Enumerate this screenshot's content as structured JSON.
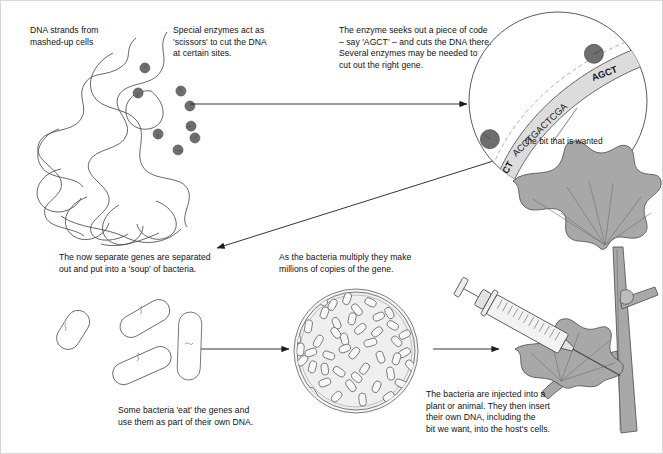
{
  "diagram": {
    "type": "process-flow-illustration",
    "background_color": "#ffffff",
    "line_color": "#3a3a3a",
    "enzyme_color": "#6e6e6e",
    "plant_color": "#a8a8a8",
    "dish_fill": "#efefef"
  },
  "captions": {
    "dna_strands": "DNA strands from\nmashed-up cells",
    "enzymes": "Special enzymes act as\n'scissors' to cut the DNA\nat certain sites.",
    "seeks_code": "The enzyme seeks out a piece of code\n– say 'AGCT' – and cuts the DNA there.\nSeveral enzymes may be needed to\ncut out the right gene.",
    "bit_wanted": "the bit that is wanted",
    "separated": "The now separate genes are separated\nout and put into a 'soup' of bacteria.",
    "multiply": "As the bacteria multiply they make\nmillions of copies of the gene.",
    "bacteria_eat": "Some bacteria 'eat' the genes and\nuse them as part of their own DNA.",
    "injected": "The bacteria are injected into a\nplant or animal. They then insert\ntheir own DNA, including the\nbit we want, into the host's cells."
  },
  "dna_sequence": {
    "full": "AGCT ACCTGACTCGA AGCT",
    "left_site": "AGCT",
    "middle_gene": "ACCTGACTCGA",
    "right_site": "AGCT"
  },
  "counts": {
    "loose_enzymes": 7,
    "magnified_enzymes": 2,
    "soup_bacteria": 4,
    "dish_bacteria": 45
  }
}
